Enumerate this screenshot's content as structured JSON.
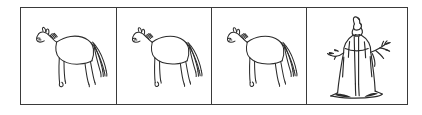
{
  "image": {
    "title": "Four-panel framed drawing strip",
    "description": "A horizontal rectangular frame divided into four panels by three vertical rules. The first three panels each contain an identical ink line drawing of a standing horse seen from the side facing left. The fourth panel contains an ink drawing of a standing robed figure wearing a tall pointed headdress with arms outstretched.",
    "background_color": "#ffffff",
    "ink_color": "#2b2b2b",
    "frame_color": "#3a3a3a"
  },
  "frame": {
    "border_label": "outer rectangular frame",
    "panel_count": 4,
    "divider_count": 3
  },
  "panels": [
    {
      "index": 1,
      "subject": "horse",
      "label": "Horse 1",
      "facing": "left",
      "description": "Side view line drawing of a standing horse facing left with raised head, short mane, four legs and a long streaming tail."
    },
    {
      "index": 2,
      "subject": "horse",
      "label": "Horse 2",
      "facing": "left",
      "description": "Side view line drawing of a standing horse facing left, identical to panel 1."
    },
    {
      "index": 3,
      "subject": "horse",
      "label": "Horse 3",
      "facing": "left",
      "description": "Side view line drawing of a standing horse facing left, identical to panels 1 and 2."
    },
    {
      "index": 4,
      "subject": "robed-figure",
      "label": "Robed figure",
      "facing": "front",
      "description": "Standing figure in a long flowing robe wearing a tall pointed headdress, both arms raised and outstretched, dark shading at the hem and base."
    }
  ]
}
